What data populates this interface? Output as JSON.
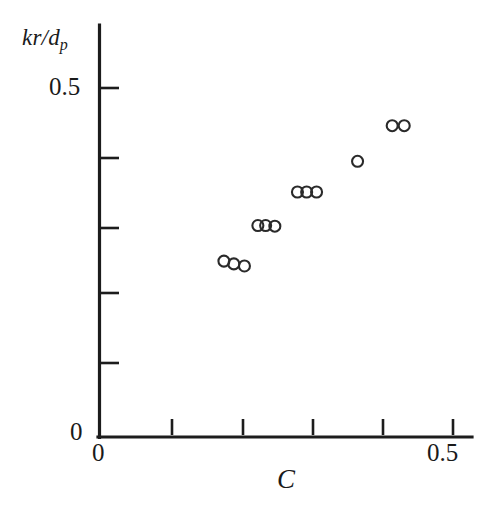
{
  "figure": {
    "background": "#ffffff",
    "ink_color": "#1c1c1c",
    "marker_color": "#2a2a2a"
  },
  "axes": {
    "y_title_main": "kr/d",
    "y_title_sub": "p",
    "x_title": "C",
    "y_tick_labels": [
      {
        "id": "ytick-05",
        "text": "0.5"
      },
      {
        "id": "ytick-0",
        "text": "0"
      }
    ],
    "x_tick_labels": [
      {
        "id": "xtick-0",
        "text": "0"
      },
      {
        "id": "xtick-05",
        "text": "0.5"
      }
    ]
  },
  "chart_data": {
    "type": "scatter",
    "title": "",
    "xlabel": "C",
    "ylabel": "kr/dp",
    "xlim": [
      0,
      0.5
    ],
    "ylim": [
      0,
      0.5
    ],
    "grid": false,
    "legend": null,
    "x_ticks": [
      0,
      0.1,
      0.2,
      0.3,
      0.4,
      0.5
    ],
    "y_ticks": [
      0,
      0.1,
      0.2,
      0.3,
      0.4,
      0.5
    ],
    "x_tick_labels_shown": [
      "0",
      "",
      "",
      "",
      "",
      "0.5"
    ],
    "y_tick_labels_shown": [
      "0",
      "",
      "",
      "",
      "",
      "0.5"
    ],
    "marker": "open-circle",
    "marker_size_px": 11,
    "series": [
      {
        "name": "measurements",
        "x": [
          0.176,
          0.19,
          0.205,
          0.224,
          0.235,
          0.248,
          0.28,
          0.293,
          0.307,
          0.365,
          0.414,
          0.431
        ],
        "y": [
          0.252,
          0.248,
          0.245,
          0.303,
          0.303,
          0.302,
          0.351,
          0.351,
          0.351,
          0.395,
          0.446,
          0.446
        ]
      }
    ],
    "clusters": [
      {
        "label": "cluster-1",
        "count": 3,
        "x_range": [
          0.176,
          0.205
        ],
        "y_approx": 0.248
      },
      {
        "label": "cluster-2",
        "count": 3,
        "x_range": [
          0.224,
          0.248
        ],
        "y_approx": 0.303
      },
      {
        "label": "cluster-3",
        "count": 3,
        "x_range": [
          0.28,
          0.307
        ],
        "y_approx": 0.351
      },
      {
        "label": "single-point",
        "count": 1,
        "x_range": [
          0.365,
          0.365
        ],
        "y_approx": 0.395
      },
      {
        "label": "cluster-4",
        "count": 2,
        "x_range": [
          0.414,
          0.431
        ],
        "y_approx": 0.446
      }
    ]
  }
}
